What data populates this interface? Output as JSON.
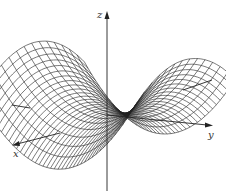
{
  "figure": {
    "surface": "z = y^2 - x^2",
    "axes": {
      "x_label": "x",
      "y_label": "y",
      "z_label": "z"
    },
    "mesh": {
      "u_lines": 40,
      "v_lines": 14
    },
    "colors": {
      "line": "#222222",
      "background": "#ffffff"
    }
  }
}
